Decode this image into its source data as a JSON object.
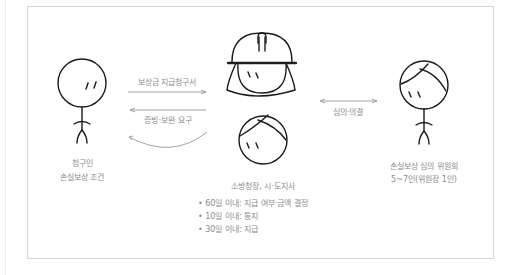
{
  "actors": {
    "claimant": {
      "name": "청구인",
      "role": "손실보상 조건"
    },
    "authority": {
      "name": "소방청장, 시·도지사",
      "duties": [
        "• 60일 이내: 지급 여부·금액 결정",
        "• 10일 이내: 통지",
        "• 30일 이내: 지급"
      ]
    },
    "committee": {
      "name": "손실보상 심의 위원회",
      "detail": "5~7인(위원장 1인)"
    }
  },
  "arrows": {
    "claim": "보상금 지급청구서",
    "supplement": "증빙·보완 요구",
    "deliberation": "심의·의결"
  },
  "colors": {
    "line": "#1a1a1a",
    "arrow": "#9a9a9a",
    "text": "#8c8c8c",
    "frame": "#d6d6d6"
  }
}
